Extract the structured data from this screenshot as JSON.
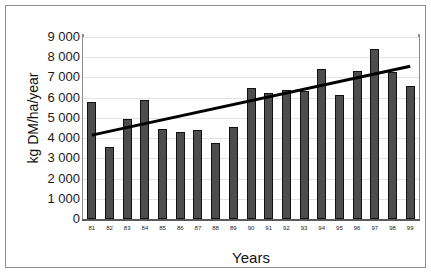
{
  "chart_data": {
    "type": "bar",
    "title": "",
    "xlabel": "Years",
    "ylabel": "kg DM/ha/year",
    "categories": [
      "81",
      "82",
      "83",
      "84",
      "85",
      "86",
      "87",
      "88",
      "89",
      "90",
      "91",
      "92",
      "93",
      "94",
      "95",
      "96",
      "97",
      "98",
      "99"
    ],
    "values": [
      5800,
      3570,
      4950,
      5900,
      4450,
      4300,
      4400,
      3760,
      4550,
      6500,
      6250,
      6400,
      6350,
      7430,
      6150,
      7330,
      8400,
      7250,
      6600
    ],
    "series": [
      {
        "name": "kg DM/ha/year",
        "type": "bar",
        "values": [
          5800,
          3570,
          4950,
          5900,
          4450,
          4300,
          4400,
          3760,
          4550,
          6500,
          6250,
          6400,
          6350,
          7430,
          6150,
          7330,
          8400,
          7250,
          6600
        ]
      },
      {
        "name": "linear trend",
        "type": "line",
        "x_start": "81",
        "x_end": "99",
        "y_start": 4150,
        "y_end": 7550
      }
    ],
    "ylim": [
      0,
      9000
    ],
    "yticks": [
      0,
      1000,
      2000,
      3000,
      4000,
      5000,
      6000,
      7000,
      8000,
      9000
    ],
    "ytick_labels": [
      "0",
      "1 000",
      "2 000",
      "3 000",
      "4 000",
      "5 000",
      "6 000",
      "7 000",
      "8 000",
      "9 000"
    ],
    "grid": true,
    "grid_axis": "y",
    "legend": false,
    "legend_position": "none",
    "colors": {
      "bar_fill": "#4d4d4d",
      "bar_edge": "#111111",
      "trendline": "#000000",
      "gridline": "#e3e3e3",
      "axis": "#8a8a8a",
      "background": "#ffffff",
      "frame": "#8e8e8e",
      "text": "#1a1a1a"
    }
  }
}
